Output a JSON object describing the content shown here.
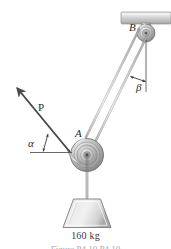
{
  "figure": {
    "type": "mechanics-free-body-diagram",
    "labels": {
      "pulley_a": "A",
      "pulley_b": "B",
      "force_p": "P",
      "angle_alpha": "α",
      "angle_beta": "β",
      "mass": "160 kg"
    },
    "caption": "Figure  P4.10    P4.10",
    "colors": {
      "line": "#4a4a4a",
      "cable": "#8a8a8a",
      "metal_light": "#e2e2e2",
      "metal_mid": "#b5b5b5",
      "metal_dark": "#7d7d7d",
      "background": "#ffffff",
      "text": "#2b2b2b"
    },
    "geometry": {
      "ceiling_beam": {
        "x": 121,
        "y": 12,
        "width": 50,
        "height": 12
      },
      "pulley_b": {
        "cx": 146,
        "cy": 33,
        "r": 9
      },
      "pulley_a": {
        "cx": 87,
        "cy": 155,
        "r": 16
      },
      "weight_block": {
        "top_y": 198,
        "bottom_y": 228,
        "top_width": 30,
        "bottom_width": 48
      },
      "arrow_p_tip": {
        "x": 15,
        "y": 86
      },
      "arrow_p_tail": {
        "x": 70,
        "y": 150
      },
      "alpha_reference_line": {
        "x1": 30,
        "y1": 152,
        "x2": 72,
        "y2": 152
      },
      "beta_reference_line": {
        "x1": 146,
        "y1": 42,
        "x2": 146,
        "y2": 92
      }
    }
  }
}
